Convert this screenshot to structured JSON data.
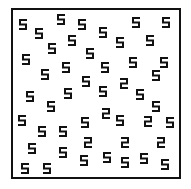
{
  "figure": {
    "frame_color": "#111111",
    "glyph_color": "#111111",
    "background": "#ffffff",
    "target_glyph": "2",
    "distractor_glyph": "5",
    "counts": {
      "5": 47,
      "2": 6
    }
  },
  "glyphs": [
    {
      "char": "5",
      "x": 23,
      "y": 24
    },
    {
      "char": "5",
      "x": 61,
      "y": 19
    },
    {
      "char": "5",
      "x": 82,
      "y": 24
    },
    {
      "char": "5",
      "x": 136,
      "y": 22
    },
    {
      "char": "5",
      "x": 166,
      "y": 22
    },
    {
      "char": "5",
      "x": 39,
      "y": 33
    },
    {
      "char": "5",
      "x": 103,
      "y": 32
    },
    {
      "char": "5",
      "x": 72,
      "y": 40
    },
    {
      "char": "5",
      "x": 120,
      "y": 42
    },
    {
      "char": "5",
      "x": 150,
      "y": 40
    },
    {
      "char": "5",
      "x": 52,
      "y": 48
    },
    {
      "char": "5",
      "x": 90,
      "y": 53
    },
    {
      "char": "5",
      "x": 26,
      "y": 59
    },
    {
      "char": "5",
      "x": 133,
      "y": 62
    },
    {
      "char": "5",
      "x": 164,
      "y": 62
    },
    {
      "char": "5",
      "x": 66,
      "y": 67
    },
    {
      "char": "5",
      "x": 105,
      "y": 67
    },
    {
      "char": "5",
      "x": 45,
      "y": 74
    },
    {
      "char": "5",
      "x": 156,
      "y": 75
    },
    {
      "char": "5",
      "x": 86,
      "y": 81
    },
    {
      "char": "2",
      "x": 124,
      "y": 83
    },
    {
      "char": "5",
      "x": 30,
      "y": 96
    },
    {
      "char": "5",
      "x": 68,
      "y": 93
    },
    {
      "char": "5",
      "x": 103,
      "y": 91
    },
    {
      "char": "5",
      "x": 140,
      "y": 94
    },
    {
      "char": "5",
      "x": 51,
      "y": 106
    },
    {
      "char": "5",
      "x": 156,
      "y": 106
    },
    {
      "char": "2",
      "x": 106,
      "y": 113
    },
    {
      "char": "5",
      "x": 22,
      "y": 120
    },
    {
      "char": "5",
      "x": 85,
      "y": 122
    },
    {
      "char": "5",
      "x": 120,
      "y": 120
    },
    {
      "char": "2",
      "x": 148,
      "y": 121
    },
    {
      "char": "5",
      "x": 170,
      "y": 122
    },
    {
      "char": "5",
      "x": 42,
      "y": 131
    },
    {
      "char": "5",
      "x": 63,
      "y": 131
    },
    {
      "char": "5",
      "x": 32,
      "y": 148
    },
    {
      "char": "5",
      "x": 63,
      "y": 152
    },
    {
      "char": "2",
      "x": 88,
      "y": 142
    },
    {
      "char": "2",
      "x": 125,
      "y": 142
    },
    {
      "char": "2",
      "x": 161,
      "y": 142
    },
    {
      "char": "5",
      "x": 84,
      "y": 160
    },
    {
      "char": "5",
      "x": 107,
      "y": 157
    },
    {
      "char": "5",
      "x": 125,
      "y": 162
    },
    {
      "char": "5",
      "x": 144,
      "y": 158
    },
    {
      "char": "5",
      "x": 165,
      "y": 164
    },
    {
      "char": "5",
      "x": 25,
      "y": 168
    },
    {
      "char": "5",
      "x": 47,
      "y": 168
    }
  ]
}
